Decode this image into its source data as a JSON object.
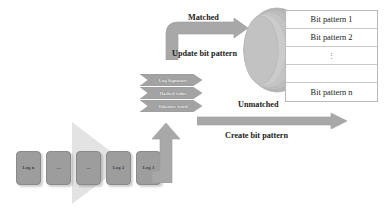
{
  "diagram": {
    "colors": {
      "arrow_gray": "#9d9d9d",
      "box_gray": "#9d9d9d",
      "triangle_gray": "#e3e3e3",
      "disk_gray": "#bdbdbd",
      "table_border": "#b8b8b8",
      "text_dark": "#1c1c1c",
      "text_light": "#efefef"
    }
  },
  "logs": {
    "items": [
      {
        "label": "Log n"
      },
      {
        "label": "—"
      },
      {
        "label": "—"
      },
      {
        "label": "Log 2"
      },
      {
        "label": "Log 1"
      }
    ]
  },
  "pipeline": {
    "steps": [
      {
        "label": "Log Signature"
      },
      {
        "label": "Hashed value"
      },
      {
        "label": "Tokenize word"
      }
    ]
  },
  "flows": {
    "matched": {
      "condition": "Matched",
      "action": "Update bit pattern"
    },
    "unmatched": {
      "condition": "Unmatched",
      "action": "Create bit pattern"
    }
  },
  "bit_pattern_store": {
    "rows": [
      {
        "label": "Bit pattern 1",
        "kind": "item"
      },
      {
        "label": "Bit pattern 2",
        "kind": "item"
      },
      {
        "label": "⋮",
        "kind": "ellipsis"
      },
      {
        "label": "",
        "kind": "blank"
      },
      {
        "label": "Bit pattern n",
        "kind": "item"
      }
    ]
  }
}
